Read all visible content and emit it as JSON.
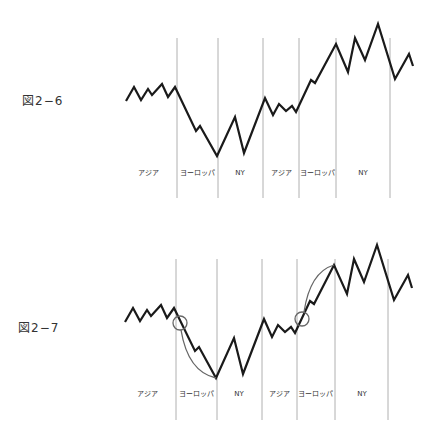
{
  "chart_data": [
    {
      "type": "line",
      "title": "図2−6",
      "sessions": [
        "アジア",
        "ヨーロッパ",
        "NY",
        "アジア",
        "ヨーロッパ",
        "NY"
      ],
      "grid_x": [
        177,
        218,
        263,
        299,
        336,
        390
      ],
      "grid_y": [
        38,
        198
      ],
      "label_y": 175,
      "label_x": [
        148,
        197,
        240,
        281,
        317,
        363
      ],
      "points": [
        [
          126,
          101
        ],
        [
          134,
          87
        ],
        [
          141,
          100
        ],
        [
          148,
          89
        ],
        [
          152,
          95
        ],
        [
          162,
          84
        ],
        [
          168,
          97
        ],
        [
          175,
          87
        ],
        [
          196,
          131
        ],
        [
          200,
          126
        ],
        [
          217,
          156
        ],
        [
          235,
          117
        ],
        [
          244,
          153
        ],
        [
          265,
          98
        ],
        [
          273,
          115
        ],
        [
          279,
          104
        ],
        [
          286,
          111
        ],
        [
          292,
          106
        ],
        [
          296,
          112
        ],
        [
          311,
          80
        ],
        [
          315,
          83
        ],
        [
          336,
          44
        ],
        [
          348,
          72
        ],
        [
          355,
          38
        ],
        [
          365,
          60
        ],
        [
          378,
          24
        ],
        [
          395,
          79
        ],
        [
          409,
          54
        ],
        [
          413,
          66
        ]
      ],
      "annotations": [],
      "grid": true,
      "axes": false
    },
    {
      "type": "line",
      "title": "図2−7",
      "sessions": [
        "アジア",
        "ヨーロッパ",
        "NY",
        "アジア",
        "ヨーロッパ",
        "NY"
      ],
      "grid_x": [
        176,
        217,
        262,
        297,
        335,
        388
      ],
      "grid_y": [
        259,
        420
      ],
      "label_y": 396,
      "label_x": [
        147,
        196,
        239,
        279,
        315,
        362
      ],
      "points": [
        [
          125,
          322
        ],
        [
          133,
          308
        ],
        [
          140,
          321
        ],
        [
          147,
          310
        ],
        [
          151,
          316
        ],
        [
          161,
          305
        ],
        [
          167,
          318
        ],
        [
          174,
          308
        ],
        [
          195,
          351
        ],
        [
          199,
          347
        ],
        [
          216,
          378
        ],
        [
          234,
          338
        ],
        [
          243,
          374
        ],
        [
          264,
          319
        ],
        [
          272,
          337
        ],
        [
          278,
          325
        ],
        [
          285,
          332
        ],
        [
          291,
          327
        ],
        [
          295,
          333
        ],
        [
          310,
          301
        ],
        [
          314,
          304
        ],
        [
          334,
          265
        ],
        [
          347,
          294
        ],
        [
          354,
          259
        ],
        [
          364,
          282
        ],
        [
          377,
          245
        ],
        [
          394,
          300
        ],
        [
          408,
          275
        ],
        [
          412,
          288
        ]
      ],
      "annotations": [
        {
          "type": "circle",
          "cx": 180,
          "cy": 323,
          "r": 7
        },
        {
          "type": "arc",
          "d": "M181,330 Q188,372 216,378"
        },
        {
          "type": "circle",
          "cx": 302,
          "cy": 319,
          "r": 7
        },
        {
          "type": "arc",
          "d": "M304,312 Q310,272 334,265"
        }
      ],
      "grid": true,
      "axes": false
    }
  ],
  "figures": [
    {
      "label": "図2−6"
    },
    {
      "label": "図2−7"
    }
  ]
}
